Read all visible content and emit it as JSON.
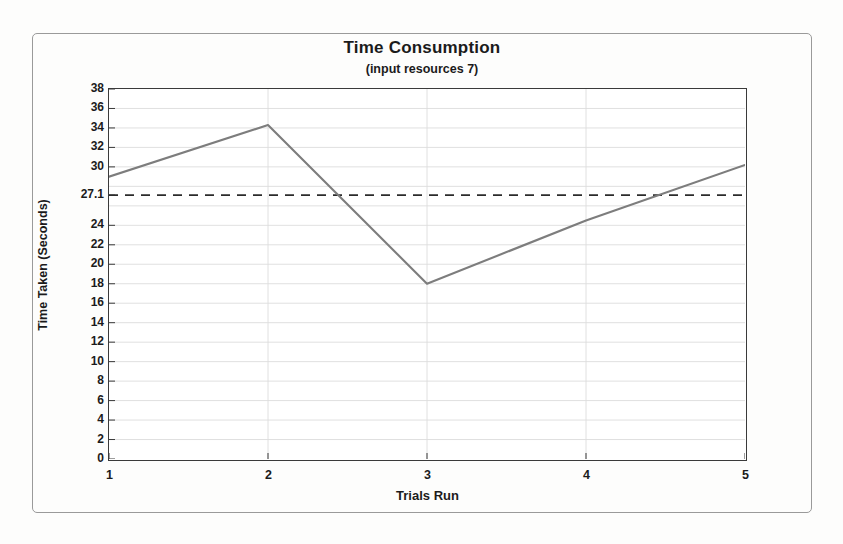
{
  "chart_data": {
    "type": "line",
    "title": "Time Consumption",
    "subtitle": "(input resources 7)",
    "xlabel": "Trials Run",
    "ylabel": "Time Taken (Seconds)",
    "x": [
      1,
      2,
      3,
      4,
      5
    ],
    "values": [
      29.0,
      34.3,
      18.0,
      24.5,
      30.2
    ],
    "series": [
      {
        "name": "Time Taken",
        "values": [
          29.0,
          34.3,
          18.0,
          24.5,
          30.2
        ],
        "color": "#7d7d7d"
      }
    ],
    "xlim": [
      1,
      5
    ],
    "ylim": [
      0,
      38
    ],
    "x_ticks": [
      "1",
      "2",
      "3",
      "4",
      "5"
    ],
    "y_ticks": [
      "0",
      "2",
      "4",
      "6",
      "8",
      "10",
      "12",
      "14",
      "16",
      "18",
      "20",
      "22",
      "24",
      "27.1",
      "30",
      "32",
      "34",
      "36",
      "38"
    ],
    "y_tick_values": [
      0,
      2,
      4,
      6,
      8,
      10,
      12,
      14,
      16,
      18,
      20,
      22,
      24,
      27.1,
      30,
      32,
      34,
      36,
      38
    ],
    "grid": true,
    "grid_color": "#dcdcdc",
    "legend": "none",
    "reference_line": {
      "label": "27.1",
      "value": 27.1,
      "style": "dashed",
      "color": "#2b2b2b"
    },
    "axis_color": "#3a3a3a",
    "plot_background": "#ffffff"
  },
  "frame": {
    "border_color": "#9a9a9a",
    "page_background": "#fdfdfc"
  }
}
